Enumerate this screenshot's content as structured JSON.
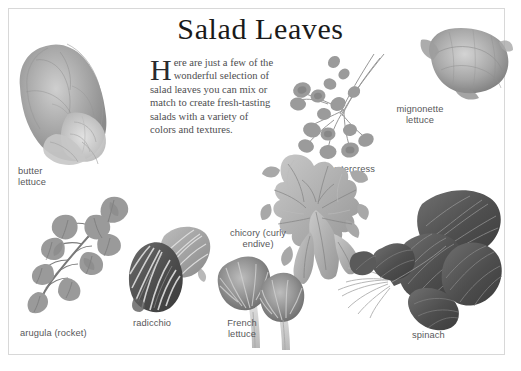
{
  "page": {
    "title": "Salad Leaves",
    "border_color": "#d8d8d8",
    "background": "#ffffff",
    "text_color": "#58585a"
  },
  "intro": {
    "dropcap": "H",
    "text": "ere are just a few of the wonderful selection of salad leaves you can mix or match to create fresh-tasting salads with a variety of colors and textures."
  },
  "specimens": [
    {
      "id": "butter-lettuce",
      "label": "butter lettuce",
      "lines": [
        "butter",
        "lettuce"
      ]
    },
    {
      "id": "mignonette-lettuce",
      "label": "mignonette lettuce",
      "lines": [
        "mignonette",
        "lettuce"
      ]
    },
    {
      "id": "watercress",
      "label": "watercress",
      "lines": [
        "watercress"
      ]
    },
    {
      "id": "chicory",
      "label": "chicory (curly endive)",
      "lines": [
        "chicory (curly",
        "endive)"
      ]
    },
    {
      "id": "arugula",
      "label": "arugula (rocket)",
      "lines": [
        "arugula (rocket)"
      ]
    },
    {
      "id": "radicchio",
      "label": "radicchio",
      "lines": [
        "radicchio"
      ]
    },
    {
      "id": "french-lettuce",
      "label": "French lettuce",
      "lines": [
        "French",
        "lettuce"
      ]
    },
    {
      "id": "spinach",
      "label": "spinach",
      "lines": [
        "spinach"
      ]
    }
  ]
}
